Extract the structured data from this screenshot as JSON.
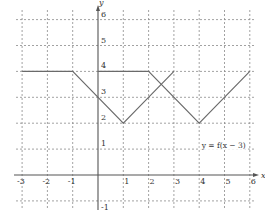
{
  "chart_data": {
    "type": "line",
    "title": "",
    "xlabel": "x",
    "ylabel": "y",
    "xlim": [
      -3,
      6
    ],
    "ylim": [
      -1,
      6
    ],
    "grid": true,
    "x_ticks": [
      -3,
      -2,
      -1,
      1,
      2,
      3,
      4,
      5,
      6
    ],
    "y_ticks": [
      -1,
      1,
      2,
      3,
      4,
      5,
      6
    ],
    "x_tick_labels": [
      "-3",
      "-2",
      "-1",
      "1",
      "2",
      "3",
      "4",
      "5",
      "6"
    ],
    "y_tick_labels": [
      "-1",
      "1",
      "2",
      "3",
      "4",
      "5",
      "6"
    ],
    "series": [
      {
        "name": "y = f(x)",
        "points": [
          [
            -3,
            4
          ],
          [
            -1,
            4
          ],
          [
            1,
            2
          ],
          [
            3,
            4
          ]
        ]
      },
      {
        "name": "y = f(x - 3)",
        "points": [
          [
            0,
            4
          ],
          [
            2,
            4
          ],
          [
            4,
            2
          ],
          [
            6,
            4
          ]
        ]
      }
    ],
    "annotations": [
      {
        "text": "y = f(x − 3)",
        "x": 4.1,
        "y": 1.05
      }
    ]
  },
  "layout": {
    "origin_px": [
      98,
      175
    ],
    "unit_x_px": 25.3,
    "unit_y_px": 25.9,
    "plot_left_px": 16,
    "plot_right_px": 256,
    "plot_top_px": 10,
    "plot_bottom_px": 208,
    "line_color": "#6a6a6a",
    "grid_color": "#8a8a8a"
  }
}
